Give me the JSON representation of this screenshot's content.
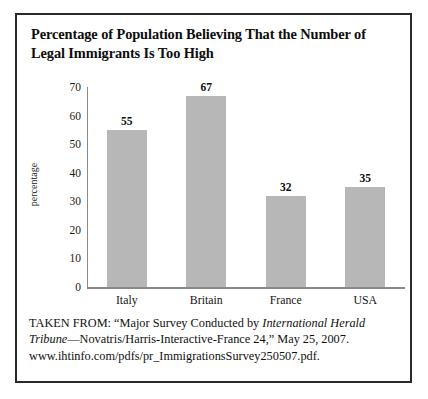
{
  "figure": {
    "title": "Percentage of Population Believing That the Number of Legal Immigrants Is Too High",
    "source_prefix": "TAKEN FROM: “Major Survey Conducted by ",
    "source_italic": "International Herald Tribune",
    "source_suffix": "—Novatris/Harris-Interactive-France 24,” May 25, 2007. www.ihtinfo.com/pdfs/pr_ImmigrationsSurvey250507.pdf."
  },
  "chart_data": {
    "type": "bar",
    "title": "Percentage of Population Believing That the Number of Legal Immigrants Is Too High",
    "categories": [
      "Italy",
      "Britain",
      "France",
      "USA"
    ],
    "values": [
      55,
      67,
      32,
      35
    ],
    "xlabel": "",
    "ylabel": "percentage",
    "ylim": [
      0,
      70
    ],
    "yticks": [
      0,
      10,
      20,
      30,
      40,
      50,
      60,
      70
    ],
    "ytick_labels": [
      "0",
      "10",
      "20",
      "30",
      "40",
      "50",
      "60",
      "70"
    ],
    "data_labels": [
      "55",
      "67",
      "32",
      "35"
    ],
    "grid": false,
    "legend": false,
    "bar_color": "#b7b7b7",
    "axis_color": "#8a8a8a"
  }
}
